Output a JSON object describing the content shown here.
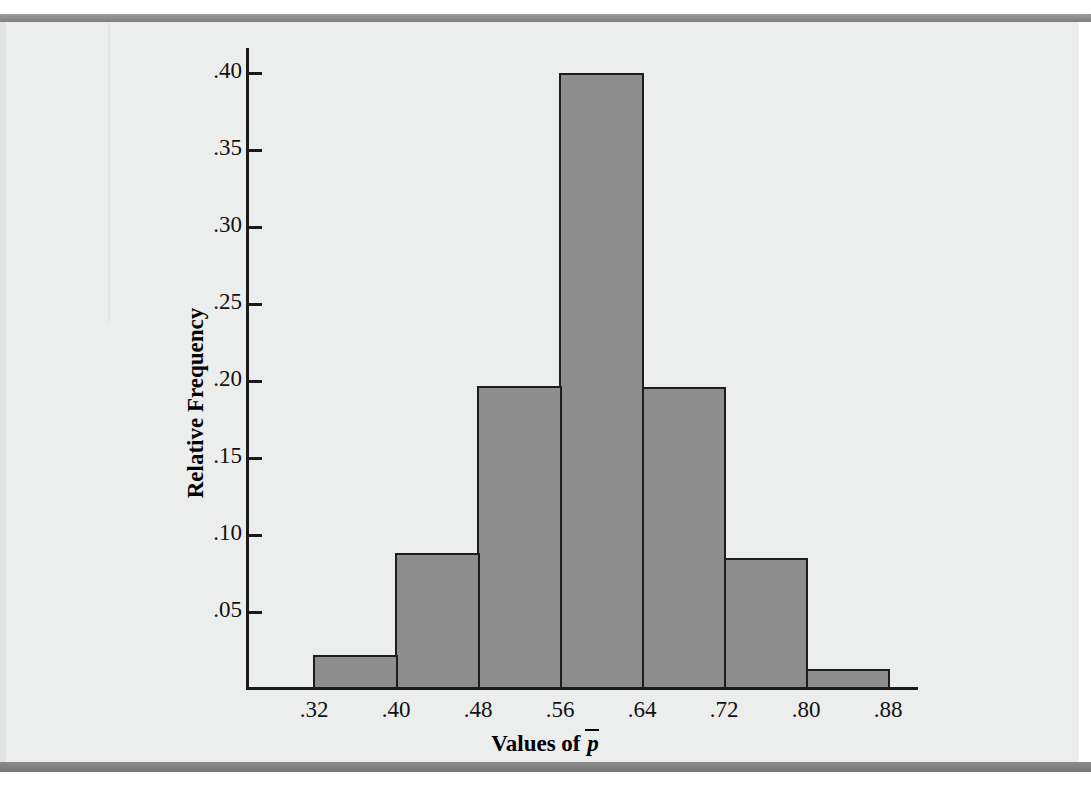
{
  "chart_data": {
    "type": "bar",
    "title": "",
    "subtitle": "",
    "xlabel": "Values of p̄",
    "xlabel_parts": {
      "prefix": "Values of ",
      "symbol": "p",
      "overbar": true
    },
    "ylabel": "Relative Frequency",
    "categories": [
      "0.28–0.36",
      "0.36–0.44",
      "0.44–0.52",
      "0.52–0.60",
      "0.60–0.68",
      "0.68–0.76",
      "0.76–0.84"
    ],
    "bin_edges": [
      0.28,
      0.36,
      0.44,
      0.52,
      0.6,
      0.68,
      0.76,
      0.84
    ],
    "values": [
      0.022,
      0.088,
      0.197,
      0.4,
      0.196,
      0.085,
      0.013
    ],
    "bar_count": 7,
    "bin_width": 0.08,
    "xtick_labels": [
      ".32",
      ".40",
      ".48",
      ".56",
      ".64",
      ".72",
      ".80",
      ".88"
    ],
    "xtick_values": [
      0.32,
      0.4,
      0.48,
      0.56,
      0.64,
      0.72,
      0.8,
      0.88
    ],
    "ytick_labels": [
      ".40",
      ".35",
      ".30",
      ".25",
      ".20",
      ".15",
      ".10",
      ".05"
    ],
    "ytick_values": [
      0.4,
      0.35,
      0.3,
      0.25,
      0.2,
      0.15,
      0.1,
      0.05
    ],
    "ylim": [
      0,
      0.4225
    ],
    "xlim": [
      0.26,
      0.92
    ],
    "grid": false,
    "legend": null,
    "legend_position": "none",
    "colors": {
      "bar_fill": "#8e8e8e",
      "bar_stroke": "#1d1d1d",
      "axis": "#1a1a1a",
      "plot_background": "#eceded",
      "frame": "#8d8d8d",
      "text": "#111111"
    }
  }
}
